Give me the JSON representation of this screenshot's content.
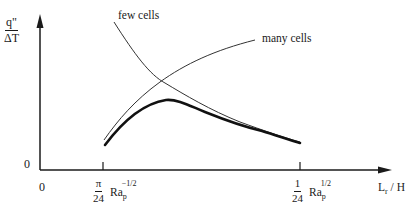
{
  "diagram": {
    "y_axis": {
      "label_numerator": "q\"",
      "label_denominator": "ΔT",
      "origin_label": "0"
    },
    "x_axis": {
      "origin_label": "0",
      "label_main": "L",
      "label_sub": "r",
      "label_tail": " / H",
      "ticks": [
        {
          "frac_num": "π",
          "frac_den": "24",
          "base": "Ra",
          "sub": "p",
          "sup": "−1/2"
        },
        {
          "frac_num": "1",
          "frac_den": "24",
          "base": "Ra",
          "sub": "p",
          "sup": "1/2"
        }
      ]
    },
    "curves": [
      {
        "name": "few cells",
        "label": "few cells",
        "style": "thin",
        "trend": "decreasing"
      },
      {
        "name": "many cells",
        "label": "many cells",
        "style": "thin",
        "trend": "increasing"
      },
      {
        "name": "envelope",
        "label": "",
        "style": "thick",
        "trend": "peak then decreasing"
      }
    ],
    "colors": {
      "ink": "#1a1a1a",
      "background": "#ffffff"
    }
  }
}
